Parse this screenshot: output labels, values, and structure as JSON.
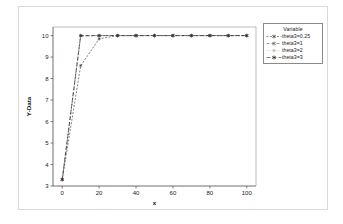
{
  "chart_data": {
    "type": "line",
    "title": "",
    "xlabel": "x",
    "ylabel": "Y-Data",
    "xlim": [
      -5,
      105
    ],
    "ylim": [
      3,
      10.4
    ],
    "xticks": [
      0,
      20,
      40,
      60,
      80,
      100
    ],
    "xtick_labels": [
      "0",
      "20",
      "40",
      "60",
      "80",
      "100"
    ],
    "yticks": [
      3,
      4,
      5,
      6,
      7,
      8,
      9,
      10
    ],
    "ytick_labels": [
      "3",
      "4",
      "5",
      "6",
      "7",
      "8",
      "9",
      "10"
    ],
    "grid": false,
    "legend_position": "right",
    "legend_title": "Variable",
    "x": [
      0,
      10,
      20,
      30,
      40,
      50,
      60,
      70,
      80,
      90,
      100
    ],
    "series": [
      {
        "name": "theta3=0.25",
        "label": "theta3=0.25",
        "color": "#3a3a3a",
        "marker": "asterisk",
        "dash": "2,1.5",
        "values": [
          3.3,
          8.6,
          9.85,
          10.0,
          10.0,
          10.0,
          10.0,
          10.0,
          10.0,
          10.0,
          10.0
        ]
      },
      {
        "name": "theta3=1",
        "label": "theta3=1",
        "color": "#5a5a5a",
        "marker": "asterisk",
        "dash": "3,2",
        "values": [
          3.3,
          9.98,
          10.0,
          10.0,
          10.0,
          10.0,
          10.0,
          10.0,
          10.0,
          10.0,
          10.0
        ]
      },
      {
        "name": "theta3=2",
        "label": "theta3=2",
        "color": "#7a7a7a",
        "marker": "asterisk",
        "dash": "1,2",
        "values": [
          3.3,
          10.0,
          10.0,
          10.0,
          10.0,
          10.0,
          10.0,
          10.0,
          10.0,
          10.0,
          10.0
        ]
      },
      {
        "name": "theta3=3",
        "label": "theta3=3",
        "color": "#2e2e2e",
        "marker": "asterisk",
        "dash": "4,2",
        "values": [
          3.3,
          10.0,
          10.0,
          10.0,
          10.0,
          10.0,
          10.0,
          10.0,
          10.0,
          10.0,
          10.0
        ]
      }
    ]
  }
}
